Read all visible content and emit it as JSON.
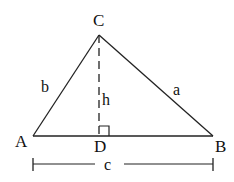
{
  "diagram": {
    "type": "triangle-with-altitude",
    "colors": {
      "stroke": "#222222",
      "text": "#111111",
      "background": "#ffffff"
    },
    "vertices": [
      {
        "id": "A",
        "label": "A",
        "x": 33,
        "y": 136
      },
      {
        "id": "B",
        "label": "B",
        "x": 213,
        "y": 136
      },
      {
        "id": "C",
        "label": "C",
        "x": 99,
        "y": 35
      }
    ],
    "foot": {
      "id": "D",
      "label": "D",
      "x": 99,
      "y": 136
    },
    "sides": {
      "b": {
        "label": "b",
        "from": "A",
        "to": "C"
      },
      "a": {
        "label": "a",
        "from": "C",
        "to": "B"
      },
      "c": {
        "label": "c",
        "from": "A",
        "to": "B"
      }
    },
    "altitude": {
      "label": "h",
      "from": "C",
      "to": "D",
      "style": "dashed"
    },
    "right_angle_marker": {
      "at": "D",
      "size": 10
    },
    "dimension_line": {
      "label": "c",
      "x1": 33,
      "x2": 213,
      "y": 164
    }
  }
}
